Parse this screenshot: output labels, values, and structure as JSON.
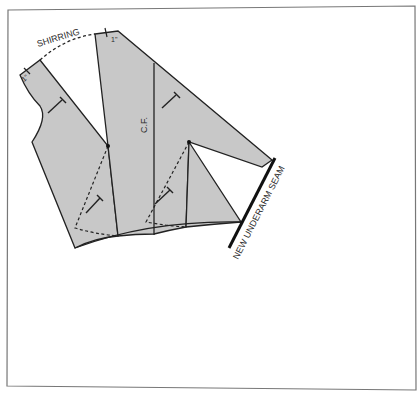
{
  "diagram": {
    "type": "sewing-pattern-slash-and-spread",
    "labels": {
      "shirring": "SHIRRING",
      "center_front": "C.F.",
      "new_underarm_seam": "NEW UNDERARM SEAM",
      "seam_allowance_left": "1\"",
      "seam_allowance_top": "1\""
    },
    "colors": {
      "fill": "#c8c8c8",
      "stroke": "#222222",
      "frame": "#777777",
      "background": "#ffffff"
    }
  }
}
